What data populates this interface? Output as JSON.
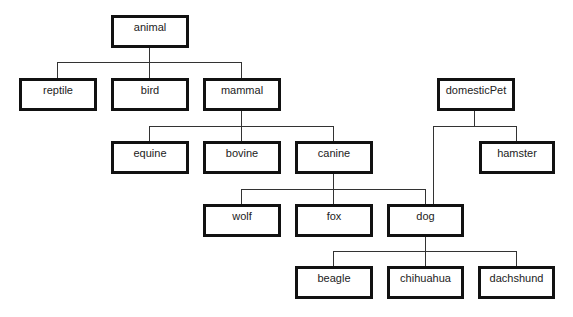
{
  "diagram": {
    "type": "class-hierarchy-tree",
    "nodes": [
      {
        "id": "animal",
        "label": "animal",
        "x": 111,
        "y": 15,
        "w": 78,
        "h": 33
      },
      {
        "id": "reptile",
        "label": "reptile",
        "x": 19,
        "y": 78,
        "w": 78,
        "h": 33
      },
      {
        "id": "bird",
        "label": "bird",
        "x": 111,
        "y": 78,
        "w": 78,
        "h": 33
      },
      {
        "id": "mammal",
        "label": "mammal",
        "x": 203,
        "y": 78,
        "w": 78,
        "h": 33
      },
      {
        "id": "domesticPet",
        "label": "domesticPet",
        "x": 437,
        "y": 78,
        "w": 78,
        "h": 33
      },
      {
        "id": "equine",
        "label": "equine",
        "x": 111,
        "y": 141,
        "w": 78,
        "h": 33
      },
      {
        "id": "bovine",
        "label": "bovine",
        "x": 203,
        "y": 141,
        "w": 78,
        "h": 33
      },
      {
        "id": "canine",
        "label": "canine",
        "x": 295,
        "y": 141,
        "w": 78,
        "h": 33
      },
      {
        "id": "hamster",
        "label": "hamster",
        "x": 479,
        "y": 141,
        "w": 76,
        "h": 33
      },
      {
        "id": "wolf",
        "label": "wolf",
        "x": 203,
        "y": 204,
        "w": 78,
        "h": 33
      },
      {
        "id": "fox",
        "label": "fox",
        "x": 295,
        "y": 204,
        "w": 78,
        "h": 33
      },
      {
        "id": "dog",
        "label": "dog",
        "x": 387,
        "y": 204,
        "w": 77,
        "h": 33
      },
      {
        "id": "beagle",
        "label": "beagle",
        "x": 295,
        "y": 266,
        "w": 78,
        "h": 33
      },
      {
        "id": "chihuahua",
        "label": "chihuahua",
        "x": 387,
        "y": 266,
        "w": 77,
        "h": 33
      },
      {
        "id": "dachshund",
        "label": "dachshund",
        "x": 478,
        "y": 266,
        "w": 77,
        "h": 33
      }
    ],
    "edges": [
      {
        "parent": "animal",
        "children": [
          "reptile",
          "bird",
          "mammal"
        ]
      },
      {
        "parent": "mammal",
        "children": [
          "equine",
          "bovine",
          "canine"
        ]
      },
      {
        "parent": "domesticPet",
        "children": [
          "dog",
          "hamster"
        ]
      },
      {
        "parent": "canine",
        "children": [
          "wolf",
          "fox",
          "dog"
        ]
      },
      {
        "parent": "dog",
        "children": [
          "beagle",
          "chihuahua",
          "dachshund"
        ]
      }
    ],
    "colors": {
      "border": "#111111",
      "line": "#333333",
      "text": "#222222",
      "background": "#ffffff"
    }
  }
}
